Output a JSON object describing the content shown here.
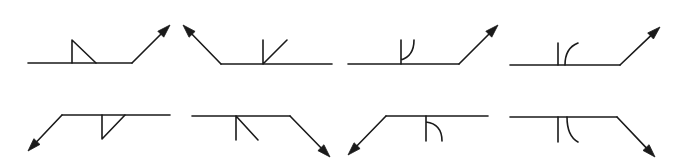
{
  "diagram": {
    "type": "welding-symbols",
    "colors": {
      "stroke": "#1a1a1a",
      "background": "#ffffff"
    },
    "symbols": [
      {
        "row": 1,
        "col": 1,
        "weld": "fillet",
        "side": "other-side",
        "arrow": "right-up",
        "ref": [
          28,
          63,
          132,
          63
        ],
        "arrow_line": [
          132,
          63,
          170,
          25
        ],
        "shape": "M72,63 L72,40 L96,63"
      },
      {
        "row": 1,
        "col": 2,
        "weld": "bevel",
        "side": "other-side",
        "arrow": "left-up",
        "ref": [
          221,
          64,
          332,
          64
        ],
        "arrow_line": [
          221,
          64,
          183,
          25
        ],
        "shape": "M263,64 L263,40 M263,64 L287,40"
      },
      {
        "row": 1,
        "col": 3,
        "weld": "j-groove",
        "side": "other-side",
        "arrow": "right-up",
        "ref": [
          348,
          64,
          459,
          64
        ],
        "arrow_line": [
          459,
          64,
          498,
          25
        ],
        "shape": "M401,64 L401,40 M401,60 Q414,56 414,40"
      },
      {
        "row": 1,
        "col": 4,
        "weld": "flare-bevel",
        "side": "other-side",
        "arrow": "right-up",
        "ref": [
          510,
          65,
          620,
          65
        ],
        "arrow_line": [
          620,
          65,
          660,
          27
        ],
        "shape": "M558,65 L558,43 M565,65 Q565,48 578,43"
      },
      {
        "row": 2,
        "col": 1,
        "weld": "fillet",
        "side": "arrow-side",
        "arrow": "left-down",
        "ref": [
          62,
          115,
          170,
          115
        ],
        "arrow_line": [
          62,
          115,
          28,
          151
        ],
        "shape": "M102,115 L102,139 L125,115"
      },
      {
        "row": 2,
        "col": 2,
        "weld": "bevel",
        "side": "arrow-side",
        "arrow": "right-down",
        "ref": [
          192,
          116,
          290,
          116
        ],
        "arrow_line": [
          290,
          116,
          330,
          157
        ],
        "shape": "M236,116 L236,140 M236,116 L258,140"
      },
      {
        "row": 2,
        "col": 3,
        "weld": "j-groove",
        "side": "arrow-side",
        "arrow": "left-down",
        "ref": [
          386,
          116,
          488,
          116
        ],
        "arrow_line": [
          386,
          116,
          348,
          155
        ],
        "shape": "M426,116 L426,141 M426,122 Q442,124 442,141"
      },
      {
        "row": 2,
        "col": 4,
        "weld": "flare-bevel",
        "side": "arrow-side",
        "arrow": "right-down",
        "ref": [
          510,
          117,
          617,
          117
        ],
        "arrow_line": [
          617,
          117,
          655,
          157
        ],
        "shape": "M558,117 L558,142 M567,117 Q567,136 578,142"
      }
    ]
  }
}
